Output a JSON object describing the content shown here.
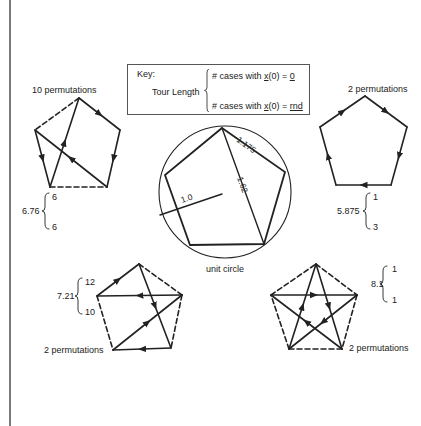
{
  "key": {
    "title": "Key:",
    "tour_length_label": "Tour Length",
    "row_top_prefix": "# cases with ",
    "row_top_var": "x",
    "row_top_mid": "(0)  =  ",
    "row_top_value": "0",
    "row_bottom_prefix": "# cases with ",
    "row_bottom_var": "x",
    "row_bottom_mid": "(0)  =  ",
    "row_bottom_value": "rnd"
  },
  "center": {
    "caption": "unit circle",
    "radius_label": "1.0",
    "side_label": "1.175",
    "diagonal_label": "1.62"
  },
  "panels": [
    {
      "id": "top-left",
      "permutations_label": "10 permutations",
      "tour_length": "6.76",
      "cases_zero": "6",
      "cases_rnd": "6"
    },
    {
      "id": "top-right",
      "permutations_label": "2 permutations",
      "tour_length": "5.875",
      "cases_zero": "1",
      "cases_rnd": "3"
    },
    {
      "id": "bottom-left",
      "permutations_label": "10 permutations",
      "tour_length": "7.21",
      "cases_zero": "12",
      "cases_rnd": "10"
    },
    {
      "id": "bottom-right",
      "permutations_label": "2 permutations",
      "tour_length": "8.1",
      "cases_zero": "1",
      "cases_rnd": "1"
    }
  ],
  "colors": {
    "ink": "#222222",
    "border": "#7a7a7a"
  }
}
